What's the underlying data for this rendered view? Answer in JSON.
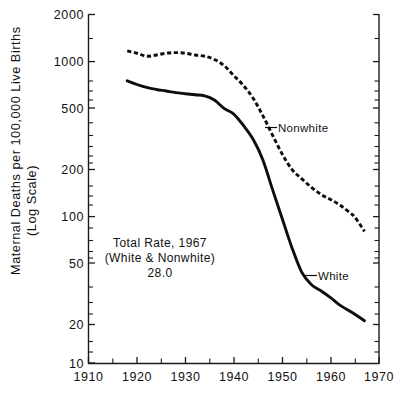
{
  "chart_data": {
    "type": "line",
    "title": "",
    "subtitle": "",
    "xlabel": "",
    "ylabel": "Maternal Deaths per 100,000 Live Births",
    "ylabel_line2": "(Log Scale)",
    "yscale": "log",
    "ylim": [
      10,
      2000
    ],
    "xlim": [
      1910,
      1970
    ],
    "grid": false,
    "legend_position": "inline-annotation",
    "y_ticks": [
      10,
      20,
      50,
      100,
      200,
      500,
      1000,
      2000
    ],
    "y_tick_labels": [
      "10",
      "20",
      "50",
      "100",
      "200",
      "500",
      "1000",
      "2000"
    ],
    "x_ticks": [
      1910,
      1920,
      1930,
      1940,
      1950,
      1960,
      1970
    ],
    "x_tick_labels": [
      "1910",
      "1920",
      "1930",
      "1940",
      "1950",
      "1960",
      "1970"
    ],
    "x_minor_ticks": [
      1915,
      1925,
      1935,
      1945,
      1955,
      1965
    ],
    "series": [
      {
        "name": "Nonwhite",
        "style": "dashed",
        "x": [
          1918,
          1920,
          1922,
          1924,
          1926,
          1928,
          1930,
          1932,
          1934,
          1936,
          1938,
          1940,
          1942,
          1944,
          1946,
          1948,
          1950,
          1952,
          1954,
          1956,
          1958,
          1960,
          1962,
          1964,
          1965,
          1967
        ],
        "values": [
          1150,
          1110,
          1060,
          1080,
          1110,
          1120,
          1110,
          1080,
          1060,
          1010,
          920,
          790,
          680,
          560,
          430,
          320,
          240,
          190,
          165,
          145,
          130,
          120,
          110,
          98,
          92,
          74
        ]
      },
      {
        "name": "White",
        "style": "solid",
        "x": [
          1918,
          1920,
          1922,
          1924,
          1926,
          1928,
          1930,
          1932,
          1934,
          1936,
          1938,
          1940,
          1942,
          1944,
          1946,
          1948,
          1950,
          1952,
          1954,
          1956,
          1958,
          1960,
          1962,
          1964,
          1965,
          1967
        ],
        "values": [
          730,
          690,
          660,
          640,
          625,
          610,
          600,
          590,
          580,
          545,
          480,
          440,
          370,
          300,
          220,
          140,
          90,
          58,
          40,
          33,
          30,
          27,
          24,
          22,
          21,
          19
        ]
      }
    ],
    "annotations": [
      {
        "name": "total-rate-note",
        "lines": [
          "Total Rate, 1967",
          "(White & Nonwhite)",
          "28.0"
        ],
        "x": 1929,
        "y": 62
      },
      {
        "name": "nonwhite-label",
        "text": "Nonwhite",
        "x": 1950,
        "y": 420
      },
      {
        "name": "white-label",
        "text": "White",
        "x": 1958,
        "y": 45
      }
    ]
  },
  "axis": {
    "y_title_line1": "Maternal Deaths per 100,000 Live Births",
    "y_title_line2": "(Log Scale)"
  },
  "labels": {
    "nonwhite": "Nonwhite",
    "white": "White",
    "note_line1": "Total Rate, 1967",
    "note_line2": "(White & Nonwhite)",
    "note_line3": "28.0"
  },
  "ticks": {
    "y": [
      "2000",
      "1000",
      "500",
      "200",
      "100",
      "50",
      "20",
      "10"
    ],
    "x": [
      "1910",
      "1920",
      "1930",
      "1940",
      "1950",
      "1960",
      "1970"
    ]
  },
  "colors": {
    "ink": "#0d0d0d",
    "background": "#ffffff"
  }
}
